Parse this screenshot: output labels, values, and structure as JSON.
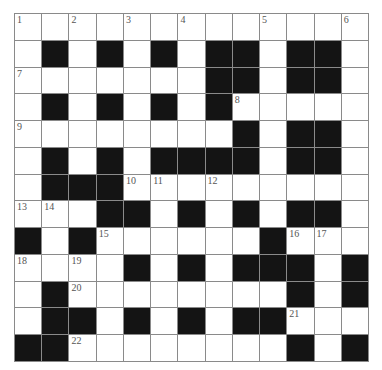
{
  "puzzle": {
    "rows": 13,
    "cols": 13,
    "colors": {
      "black": "#141414",
      "white": "#ffffff",
      "line": "#8a8a8a",
      "number": "#555555"
    },
    "layout": [
      ".............",
      ".#.#.#.##.##.",
      ".......##.##.",
      ".#.#.#.#.....",
      "........#.##.",
      ".#.#.####.##.",
      ".###.........",
      "...##.#.#.##.",
      "#.#......#...",
      "....#.#.###.#",
      ".#........#.#",
      ".##.#.#.##...",
      "##........#.#"
    ],
    "numbers": [
      {
        "r": 0,
        "c": 0,
        "n": "1"
      },
      {
        "r": 0,
        "c": 2,
        "n": "2"
      },
      {
        "r": 0,
        "c": 4,
        "n": "3"
      },
      {
        "r": 0,
        "c": 6,
        "n": "4"
      },
      {
        "r": 0,
        "c": 9,
        "n": "5"
      },
      {
        "r": 0,
        "c": 12,
        "n": "6"
      },
      {
        "r": 2,
        "c": 0,
        "n": "7"
      },
      {
        "r": 3,
        "c": 8,
        "n": "8"
      },
      {
        "r": 4,
        "c": 0,
        "n": "9"
      },
      {
        "r": 6,
        "c": 4,
        "n": "10"
      },
      {
        "r": 6,
        "c": 5,
        "n": "11"
      },
      {
        "r": 6,
        "c": 7,
        "n": "12"
      },
      {
        "r": 7,
        "c": 0,
        "n": "13"
      },
      {
        "r": 7,
        "c": 1,
        "n": "14"
      },
      {
        "r": 8,
        "c": 3,
        "n": "15"
      },
      {
        "r": 8,
        "c": 10,
        "n": "16"
      },
      {
        "r": 8,
        "c": 11,
        "n": "17"
      },
      {
        "r": 9,
        "c": 0,
        "n": "18"
      },
      {
        "r": 9,
        "c": 2,
        "n": "19"
      },
      {
        "r": 10,
        "c": 2,
        "n": "20"
      },
      {
        "r": 11,
        "c": 10,
        "n": "21"
      },
      {
        "r": 12,
        "c": 2,
        "n": "22"
      }
    ]
  }
}
